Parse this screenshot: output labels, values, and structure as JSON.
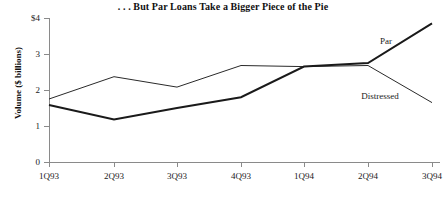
{
  "chart_data": {
    "type": "line",
    "title": ". . . But Par Loans Take a Bigger Piece of the Pie",
    "xlabel": "",
    "ylabel": "Volume ($ billions)",
    "categories": [
      "1Q93",
      "2Q93",
      "3Q93",
      "4Q93",
      "1Q94",
      "2Q94",
      "3Q94"
    ],
    "ylim": [
      0,
      4
    ],
    "yticks": [
      0,
      1,
      2,
      3,
      4
    ],
    "ytick_labels": [
      "0",
      "1",
      "2",
      "3",
      "$4"
    ],
    "grid": false,
    "legend_position": "inline-annotations",
    "series": [
      {
        "name": "Par",
        "values": [
          1.58,
          1.18,
          1.5,
          1.8,
          2.65,
          2.75,
          3.85
        ],
        "color": "#1a1a1a",
        "line_width": 2.0,
        "annotation": {
          "text": "Par",
          "x_px": 386,
          "y_px": 44
        }
      },
      {
        "name": "Distressed",
        "values": [
          1.75,
          2.37,
          2.08,
          2.68,
          2.65,
          2.68,
          1.65
        ],
        "color": "#2a2a2a",
        "line_width": 1.0,
        "annotation": {
          "text": "Distressed",
          "x_px": 380,
          "y_px": 99
        }
      }
    ]
  },
  "axes": {
    "axis_color": "#8a8a8a",
    "x_pixel_positions": [
      49,
      114,
      177,
      241,
      304,
      368,
      432
    ],
    "y_pixel_top": 18,
    "y_pixel_bottom": 162
  }
}
